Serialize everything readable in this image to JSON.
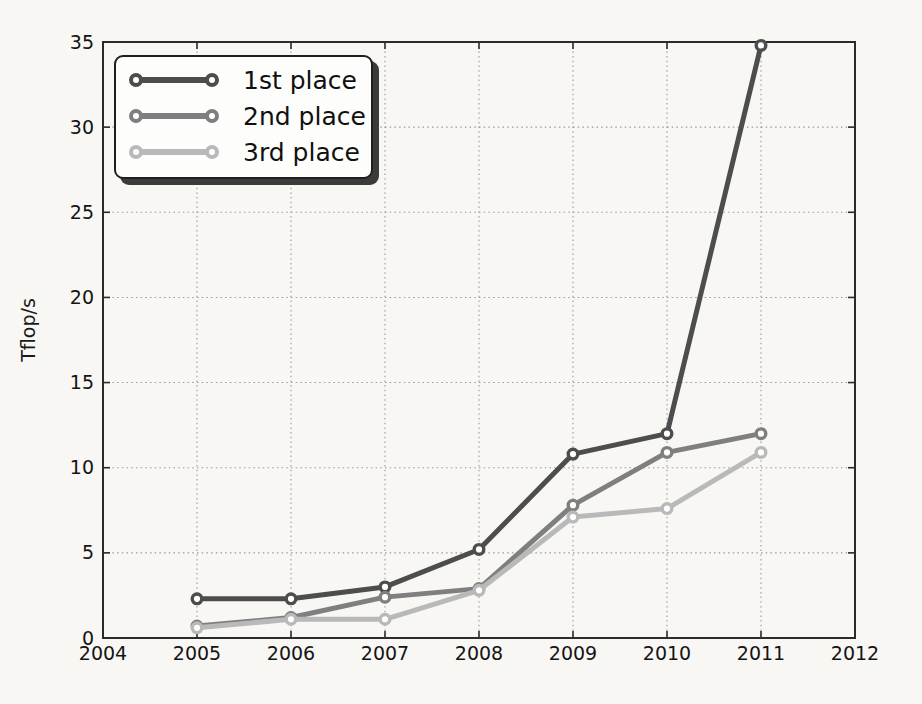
{
  "figure": {
    "background": "#f8f7f4"
  },
  "chart_data": {
    "type": "line",
    "title": "",
    "xlabel": "",
    "ylabel": "Tflop/s",
    "x": [
      2005,
      2006,
      2007,
      2008,
      2009,
      2010,
      2011
    ],
    "xlim": [
      2004,
      2012
    ],
    "ylim": [
      0,
      35
    ],
    "xticks": [
      2004,
      2005,
      2006,
      2007,
      2008,
      2009,
      2010,
      2011,
      2012
    ],
    "yticks": [
      0,
      5,
      10,
      15,
      20,
      25,
      30,
      35
    ],
    "grid": {
      "show": true,
      "style": "dotted",
      "color": "#999999"
    },
    "axis_color": "#2b2b2b",
    "tick_label_color": "#141414",
    "marker": {
      "shape": "circle",
      "fill": "#ffffff"
    },
    "legend": {
      "position": "upper-left",
      "shadow": true
    },
    "series": [
      {
        "name": "1st place",
        "color": "#4d4d4d",
        "values": [
          2.3,
          2.3,
          3.0,
          5.2,
          10.8,
          12.0,
          34.8
        ]
      },
      {
        "name": "2nd place",
        "color": "#7f7f7f",
        "values": [
          0.7,
          1.2,
          2.4,
          2.9,
          7.8,
          10.9,
          12.0
        ]
      },
      {
        "name": "3rd place",
        "color": "#b9b9b9",
        "values": [
          0.6,
          1.1,
          1.1,
          2.8,
          7.1,
          7.6,
          10.9
        ]
      }
    ]
  }
}
